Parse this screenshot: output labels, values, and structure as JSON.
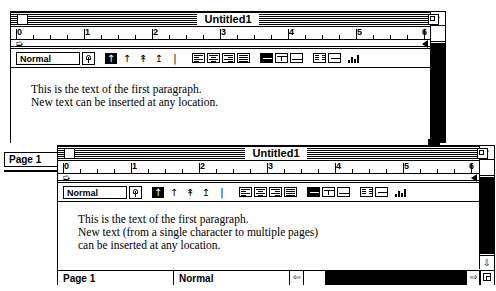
{
  "app": {
    "platform": "classic-mac-word-processor"
  },
  "window_back": {
    "title": "Untitled1",
    "close_icon": "close-box",
    "zoom_icon": "zoom-box",
    "ruler": {
      "labels": [
        "0",
        "1",
        "2",
        "3",
        "4",
        "5",
        "6"
      ],
      "unit": "inch",
      "left_indent_marker": "indent-marker",
      "right_indent_marker": "right-indent-marker"
    },
    "toolbar": {
      "style_value": "Normal",
      "style_popup_icon": "popup-arrow-icon",
      "spacing_icons": [
        "line-spacing-single-icon",
        "line-spacing-up-icon",
        "line-spacing-one-half-icon",
        "line-spacing-double-icon",
        "line-spacing-custom-icon"
      ],
      "align_icons": [
        "align-left-icon",
        "align-center-icon",
        "align-right-icon",
        "align-justify-icon"
      ],
      "tab_icons": [
        "tab-left-icon",
        "tab-center-icon",
        "tab-right-icon"
      ],
      "col_icons": [
        "columns-one-icon",
        "columns-two-icon"
      ],
      "chart_icon": "chart-icon"
    },
    "text_lines": [
      "This is the text of the first paragraph.",
      "New text can be inserted at any location."
    ],
    "scroll_up_icon": "scroll-up-arrow-icon"
  },
  "window_front": {
    "title": "Untitled1",
    "close_icon": "close-box",
    "zoom_icon": "zoom-box",
    "ruler": {
      "labels": [
        "0",
        "1",
        "2",
        "3",
        "4",
        "5",
        "6"
      ],
      "unit": "inch",
      "left_indent_marker": "indent-marker",
      "right_indent_marker": "right-indent-marker"
    },
    "toolbar": {
      "style_value": "Normal",
      "style_popup_icon": "popup-arrow-icon",
      "spacing_icons": [
        "line-spacing-single-icon",
        "line-spacing-up-icon",
        "line-spacing-one-half-icon",
        "line-spacing-double-icon",
        "line-spacing-custom-icon"
      ],
      "align_icons": [
        "align-left-icon",
        "align-center-icon",
        "align-right-icon",
        "align-justify-icon"
      ],
      "tab_icons": [
        "tab-left-icon",
        "tab-center-icon",
        "tab-right-icon"
      ],
      "col_icons": [
        "columns-one-icon",
        "columns-two-icon"
      ],
      "chart_icon": "chart-icon"
    },
    "text_lines": [
      "This is the text of the first paragraph.",
      "New text (from a single character to multiple pages)",
      "can be inserted at any location."
    ],
    "status": {
      "page_label": "Page 1",
      "style_label": "Normal",
      "left_arrow_icon": "scroll-left-arrow-icon",
      "right_arrow_icon": "scroll-right-arrow-icon",
      "grow_icon": "grow-box-icon"
    },
    "scroll_up_icon": "scroll-up-arrow-icon",
    "scroll_down_icon": "scroll-down-arrow-icon"
  },
  "background_page": {
    "page_label": "Page 1"
  }
}
